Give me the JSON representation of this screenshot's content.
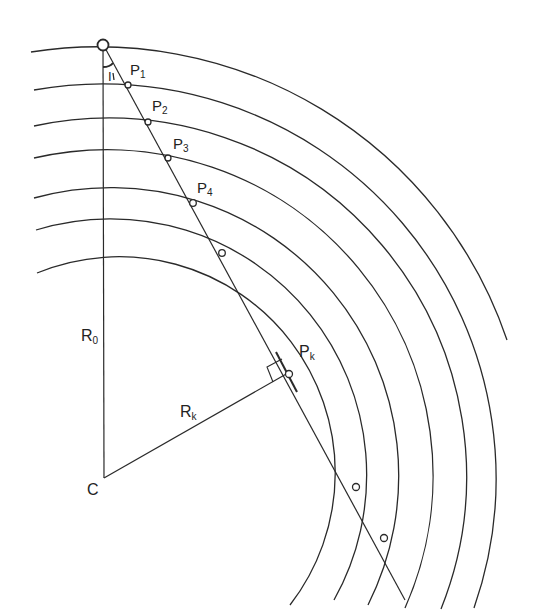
{
  "diagram": {
    "center_label": "C",
    "radius_labels": {
      "r0": {
        "main": "R",
        "sub": "0"
      },
      "rk": {
        "main": "R",
        "sub": "k"
      }
    },
    "angle_label": "I",
    "points": [
      {
        "main": "P",
        "sub": "1"
      },
      {
        "main": "P",
        "sub": "2"
      },
      {
        "main": "P",
        "sub": "3"
      },
      {
        "main": "P",
        "sub": "4"
      },
      {
        "main": "P",
        "sub": "k"
      }
    ],
    "stroke_color": "#2a2a2a",
    "background_color": "#ffffff"
  }
}
